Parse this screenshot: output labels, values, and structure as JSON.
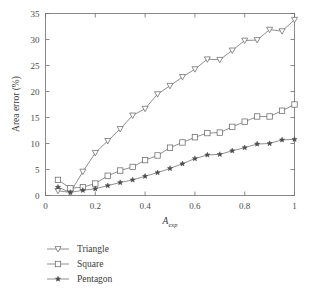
{
  "chart_data": {
    "type": "line",
    "title": "",
    "xlabel": "A_exp",
    "xlabel_base": "A",
    "xlabel_sub": "exp",
    "ylabel": "Area error (%)",
    "xlim": [
      0,
      1
    ],
    "ylim": [
      0,
      35
    ],
    "xticks": [
      0,
      0.2,
      0.4,
      0.6,
      0.8,
      1
    ],
    "xtick_labels": [
      "0",
      "0.2",
      "0.4",
      "0.6",
      "0.8",
      "1"
    ],
    "yticks": [
      0,
      5,
      10,
      15,
      20,
      25,
      30,
      35
    ],
    "ytick_labels": [
      "0",
      "5",
      "10",
      "15",
      "20",
      "25",
      "30",
      "35"
    ],
    "grid": false,
    "legend_position": "below-left",
    "x": [
      0.05,
      0.1,
      0.15,
      0.2,
      0.25,
      0.3,
      0.35,
      0.4,
      0.45,
      0.5,
      0.55,
      0.6,
      0.65,
      0.7,
      0.75,
      0.8,
      0.85,
      0.9,
      0.95,
      1.0
    ],
    "series": [
      {
        "name": "Triangle",
        "marker": "triangle-down-open",
        "values": [
          0.9,
          0.6,
          4.6,
          8.2,
          10.5,
          12.8,
          15.4,
          16.7,
          19.5,
          21.1,
          22.8,
          24.3,
          26.2,
          26.1,
          27.9,
          29.8,
          29.9,
          31.9,
          31.6,
          33.8
        ]
      },
      {
        "name": "Square",
        "marker": "square-open",
        "values": [
          3.0,
          1.4,
          1.6,
          2.3,
          3.8,
          4.8,
          5.5,
          6.8,
          7.7,
          9.2,
          10.2,
          11.2,
          12.0,
          12.1,
          13.2,
          14.2,
          15.2,
          15.2,
          16.3,
          17.5
        ]
      },
      {
        "name": "Pentagon",
        "marker": "star-filled",
        "values": [
          1.6,
          0.6,
          1.0,
          1.3,
          1.9,
          2.5,
          3.0,
          3.7,
          4.4,
          5.2,
          6.1,
          7.1,
          7.8,
          7.9,
          8.6,
          9.2,
          9.9,
          10.0,
          10.7,
          10.8
        ]
      }
    ]
  },
  "legend": {
    "items": [
      {
        "label": "Triangle"
      },
      {
        "label": "Square"
      },
      {
        "label": "Pentagon"
      }
    ]
  },
  "colors": {
    "line": "#6b6b6b",
    "axis": "#6e6e6e",
    "text": "#3a3a3a",
    "marker_fill": "#ffffff",
    "marker_edge": "#5e5e5e",
    "marker_filled": "#4a4a4a",
    "background": "#ffffff"
  }
}
